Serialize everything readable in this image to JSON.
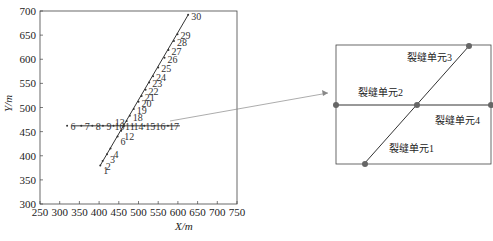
{
  "chart_data": {
    "type": "scatter",
    "title": "",
    "xlabel": "X/m",
    "ylabel": "Y/m",
    "xlim": [
      250,
      750
    ],
    "ylim": [
      300,
      700
    ],
    "xticks": [
      "250",
      "300",
      "350",
      "400",
      "450",
      "500",
      "550",
      "600",
      "650",
      "700",
      "750"
    ],
    "yticks": [
      "300",
      "350",
      "400",
      "450",
      "500",
      "550",
      "600",
      "650",
      "700"
    ],
    "grid": false,
    "series": [
      {
        "name": "inclined fracture",
        "points": [
          {
            "label": "1",
            "x": 403,
            "y": 380
          },
          {
            "label": "2",
            "x": 409,
            "y": 389
          },
          {
            "label": "3",
            "x": 420,
            "y": 403
          },
          {
            "label": "4",
            "x": 429,
            "y": 415
          },
          {
            "label": "6",
            "x": 447,
            "y": 440
          },
          {
            "label": "12",
            "x": 456,
            "y": 452
          },
          {
            "label": "10",
            "x": 462,
            "y": 461
          },
          {
            "label": "13",
            "x": 470,
            "y": 472
          },
          {
            "label": "18",
            "x": 478,
            "y": 483
          },
          {
            "label": "19",
            "x": 488,
            "y": 497
          },
          {
            "label": "20",
            "x": 500,
            "y": 512
          },
          {
            "label": "21",
            "x": 508,
            "y": 524
          },
          {
            "label": "22",
            "x": 518,
            "y": 537
          },
          {
            "label": "23",
            "x": 527,
            "y": 552
          },
          {
            "label": "24",
            "x": 537,
            "y": 565
          },
          {
            "label": "25",
            "x": 550,
            "y": 583
          },
          {
            "label": "26",
            "x": 566,
            "y": 603
          },
          {
            "label": "27",
            "x": 576,
            "y": 619
          },
          {
            "label": "28",
            "x": 590,
            "y": 638
          },
          {
            "label": "29",
            "x": 599,
            "y": 652
          },
          {
            "label": "30",
            "x": 626,
            "y": 692
          }
        ]
      },
      {
        "name": "horizontal fracture",
        "points": [
          {
            "label": "6",
            "x": 334,
            "y": 462
          },
          {
            "label": "7",
            "x": 370,
            "y": 462
          },
          {
            "label": "8",
            "x": 398,
            "y": 462
          },
          {
            "label": "9",
            "x": 425,
            "y": 462
          },
          {
            "label": "10",
            "x": 452,
            "y": 462
          },
          {
            "label": "11",
            "x": 478,
            "y": 462
          },
          {
            "label": "14",
            "x": 500,
            "y": 462
          },
          {
            "label": "15",
            "x": 530,
            "y": 462
          },
          {
            "label": "16",
            "x": 556,
            "y": 462
          },
          {
            "label": "17",
            "x": 590,
            "y": 462
          }
        ],
        "x_range": [
          330,
          605
        ]
      }
    ]
  },
  "inset": {
    "labels": [
      "裂缝单元1",
      "裂缝单元2",
      "裂缝单元3",
      "裂缝单元4"
    ]
  },
  "caption": ""
}
